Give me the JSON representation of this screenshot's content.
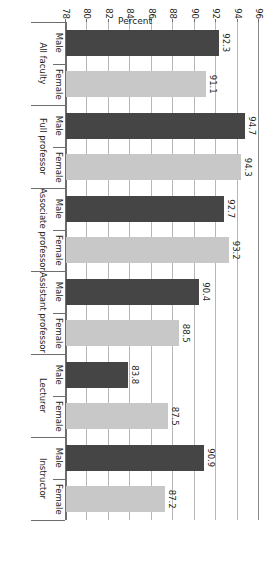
{
  "chart_data": {
    "type": "bar",
    "title": "",
    "orientation": "horizontal-rotated",
    "xlabel": "",
    "ylabel": "Percent",
    "ylim": [
      78,
      96
    ],
    "yticks": [
      96,
      94,
      92,
      90,
      88,
      86,
      84,
      82,
      80,
      78
    ],
    "grid": true,
    "legend": "none",
    "categories": [
      "All faculty",
      "Full professor",
      "Associate professor",
      "Assistant professor",
      "Lecturer",
      "Instructor"
    ],
    "subcategories": [
      "Male",
      "Female"
    ],
    "series": [
      {
        "name": "Male",
        "values": [
          92.3,
          94.7,
          92.7,
          90.4,
          83.8,
          90.9
        ],
        "color": "#454545"
      },
      {
        "name": "Female",
        "values": [
          91.1,
          94.3,
          93.2,
          88.5,
          87.5,
          87.2
        ],
        "color": "#c8c8c8"
      }
    ],
    "bars": [
      {
        "group": "All faculty",
        "sex": "Male",
        "value": 92.3,
        "label": "92.3",
        "color": "#454545"
      },
      {
        "group": "All faculty",
        "sex": "Female",
        "value": 91.1,
        "label": "91.1",
        "color": "#c8c8c8"
      },
      {
        "group": "Full professor",
        "sex": "Male",
        "value": 94.7,
        "label": "94.7",
        "color": "#454545"
      },
      {
        "group": "Full professor",
        "sex": "Female",
        "value": 94.3,
        "label": "94.3",
        "color": "#c8c8c8"
      },
      {
        "group": "Associate professor",
        "sex": "Male",
        "value": 92.7,
        "label": "92.7",
        "color": "#454545"
      },
      {
        "group": "Associate professor",
        "sex": "Female",
        "value": 93.2,
        "label": "93.2",
        "color": "#c8c8c8"
      },
      {
        "group": "Assistant professor",
        "sex": "Male",
        "value": 90.4,
        "label": "90.4",
        "color": "#454545"
      },
      {
        "group": "Assistant professor",
        "sex": "Female",
        "value": 88.5,
        "label": "88.5",
        "color": "#c8c8c8"
      },
      {
        "group": "Lecturer",
        "sex": "Male",
        "value": 83.8,
        "label": "83.8",
        "color": "#454545"
      },
      {
        "group": "Lecturer",
        "sex": "Female",
        "value": 87.5,
        "label": "87.5",
        "color": "#c8c8c8"
      },
      {
        "group": "Instructor",
        "sex": "Male",
        "value": 90.9,
        "label": "90.9",
        "color": "#454545"
      },
      {
        "group": "Instructor",
        "sex": "Female",
        "value": 87.2,
        "label": "87.2",
        "color": "#c8c8c8"
      }
    ]
  },
  "axis": {
    "value_axis_title": "Percent",
    "value_tick_labels": [
      "96",
      "94",
      "92",
      "90",
      "88",
      "86",
      "84",
      "82",
      "80",
      "78"
    ],
    "category_tick_labels": [
      "Male",
      "Female",
      "Male",
      "Female",
      "Male",
      "Female",
      "Male",
      "Female",
      "Male",
      "Female",
      "Male",
      "Female"
    ],
    "group_labels": [
      "All faculty",
      "Full professor",
      "Associate professor",
      "Assistant professor",
      "Lecturer",
      "Instructor"
    ]
  },
  "colors": {
    "male_bar": "#454545",
    "female_bar": "#c8c8c8",
    "gridline": "#b7b7b7",
    "axis": "#6e6e6e",
    "text": "#231f20",
    "background": "#ffffff"
  }
}
